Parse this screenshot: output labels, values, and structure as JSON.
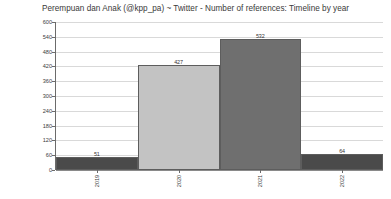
{
  "chart_data": {
    "type": "bar",
    "title": "Perempuan dan Anak (@kpp_pa) ~ Twitter - Number of references: Timeline by year",
    "xlabel": "",
    "ylabel": "Number of references",
    "categories": [
      "2019",
      "2020",
      "2021",
      "2022"
    ],
    "values": [
      51,
      427,
      532,
      64
    ],
    "value_labels": [
      "51",
      "427",
      "532",
      "64"
    ],
    "bar_colors": [
      "#4a4a4a",
      "#c3c3c3",
      "#6f6f6f",
      "#4a4a4a"
    ],
    "bar_border_color": "#5d5d5d",
    "ylim": [
      0,
      600
    ],
    "y_ticks": [
      0,
      60,
      120,
      180,
      240,
      300,
      360,
      420,
      480,
      540,
      600
    ],
    "y_tick_labels": [
      "0",
      "60",
      "120",
      "180",
      "240",
      "300",
      "360",
      "420",
      "480",
      "540",
      "600"
    ],
    "grid": true,
    "grid_color": "#d9d9d9",
    "legend": false,
    "legend_position": "none",
    "x_tick_label_rotation": -90,
    "background_color": "#ffffff",
    "title_color": "#3a3a3a",
    "axis_color": "#6b6b6b"
  }
}
